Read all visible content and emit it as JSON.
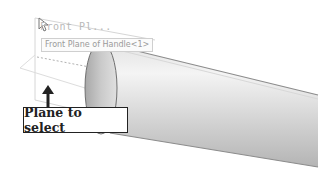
{
  "viewport": {
    "plane_label": "Front Pl...",
    "tooltip": "Front Plane of Handle<1>",
    "callout_label": "Plane to select",
    "colors": {
      "plane_edge": "#d0d0d0",
      "cylinder_light": "#ececec",
      "cylinder_dark": "#8a8a8a",
      "callout_border": "#222222"
    }
  }
}
